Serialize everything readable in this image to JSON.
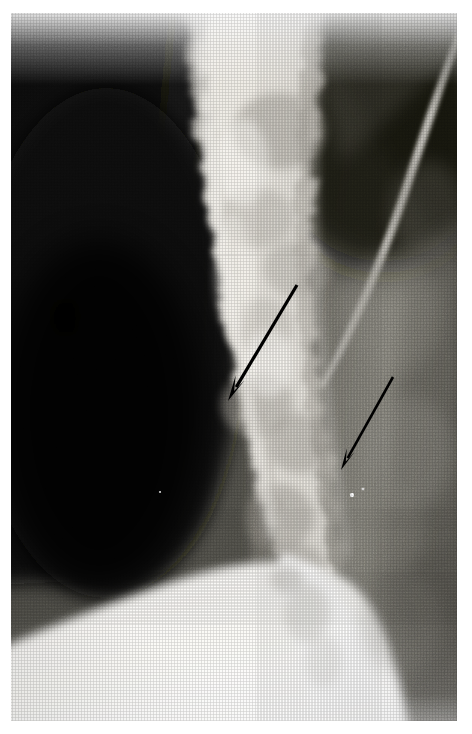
{
  "figure": {
    "kind": "radiograph",
    "modality": "plain-film-x-ray",
    "caption": "",
    "width": 472,
    "height": 734,
    "background_color": "#ffffff",
    "plate": {
      "left": 11,
      "top": 13,
      "width": 446,
      "height": 708,
      "border_color": "#ffffff"
    }
  },
  "palette": {
    "paper_white": "#ffffff",
    "bone_bright": "#f2f0ec",
    "bone_mid": "#c8c4bd",
    "soft_tissue_mid": "#8a8880",
    "soft_tissue_dark": "#4a4944",
    "air_black": "#0d0d0c",
    "deep_black": "#050505",
    "arrow_black": "#000000",
    "rib_line": "#d8d5ce"
  },
  "regions": [
    {
      "id": "left-dark-field",
      "label": "Dark radiolucent field (left)",
      "description": "Large very dark region occupying the left third, rounded convex lower-right border",
      "tone": "#0d0d0c",
      "approx_bounds": {
        "x": 0,
        "y": 0,
        "width": 215,
        "height": 580
      }
    },
    {
      "id": "central-bone-column",
      "label": "Bright vertical osseous column (center)",
      "description": "Mottled bright bone column running top to bottom through the middle of the film",
      "tone": "#e6e3dc",
      "approx_bounds": {
        "x": 165,
        "y": 0,
        "width": 160,
        "height": 620
      }
    },
    {
      "id": "right-soft-tissue",
      "label": "Mid-grey soft tissue field (right)",
      "description": "Medium grey textured soft-tissue region on the right side",
      "tone": "#76746d",
      "approx_bounds": {
        "x": 300,
        "y": 0,
        "width": 172,
        "height": 734
      }
    },
    {
      "id": "rib-line",
      "label": "Bright oblique cortical line",
      "description": "Thin bright diagonal line descending from upper right toward the centre",
      "tone": "#d8d5ce"
    },
    {
      "id": "lower-bright-mass",
      "label": "Broad bright structure (lower)",
      "description": "Large bright, nearly white bone/shoulder structure filling the lower portion of the film",
      "tone": "#f4f2ee",
      "approx_bounds": {
        "x": 0,
        "y": 545,
        "width": 400,
        "height": 189
      }
    }
  ],
  "annotations": {
    "arrow_color": "#000000",
    "arrows": [
      {
        "id": "arrow-upper",
        "label": "Upper annotation arrow",
        "tail": {
          "x": 297,
          "y": 285
        },
        "tip": {
          "x": 228,
          "y": 401
        },
        "shaft_width": 3.2,
        "head_length": 26,
        "head_width": 13,
        "points_to": "central-bone-column"
      },
      {
        "id": "arrow-lower",
        "label": "Lower annotation arrow",
        "tail": {
          "x": 393,
          "y": 377
        },
        "tip": {
          "x": 341,
          "y": 470
        },
        "shaft_width": 2.6,
        "head_length": 22,
        "head_width": 11,
        "points_to": "central-bone-column"
      }
    ]
  },
  "markers": [
    {
      "id": "speck-a",
      "x": 352,
      "y": 495,
      "radius": 2.0,
      "tone": "#ffffff"
    },
    {
      "id": "speck-b",
      "x": 363,
      "y": 489,
      "radius": 1.3,
      "tone": "#f0f0f0"
    },
    {
      "id": "speck-c",
      "x": 160,
      "y": 492,
      "radius": 1.1,
      "tone": "#cfcfcf"
    }
  ]
}
